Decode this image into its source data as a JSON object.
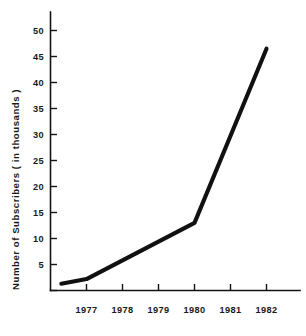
{
  "chart_data": {
    "type": "line",
    "title": "",
    "xlabel": "",
    "ylabel": "Number of Subscribers ( in thousands )",
    "x": [
      1976.3,
      1977,
      1980,
      1982
    ],
    "values": [
      1.3,
      2.2,
      13.0,
      46.5
    ],
    "series": [
      {
        "name": "Subscribers",
        "values": [
          1.3,
          2.2,
          13.0,
          46.5
        ]
      }
    ],
    "xticks": [
      "1977",
      "1978",
      "1979",
      "1980",
      "1981",
      "1982"
    ],
    "xtick_values": [
      1977,
      1978,
      1979,
      1980,
      1981,
      1982
    ],
    "yticks": [
      "5",
      "10",
      "15",
      "20",
      "25",
      "30",
      "35",
      "40",
      "45",
      "50"
    ],
    "ytick_values": [
      5,
      10,
      15,
      20,
      25,
      30,
      35,
      40,
      45,
      50
    ],
    "xlim": [
      1976.0,
      1982.6
    ],
    "ylim": [
      0,
      53
    ],
    "grid": false,
    "legend": false,
    "legend_position": "none",
    "line_color": "#111111",
    "axis_color": "#141414",
    "background_color": "#ffffff"
  },
  "axis": {
    "y_title": "Number of Subscribers ( in thousands )"
  }
}
